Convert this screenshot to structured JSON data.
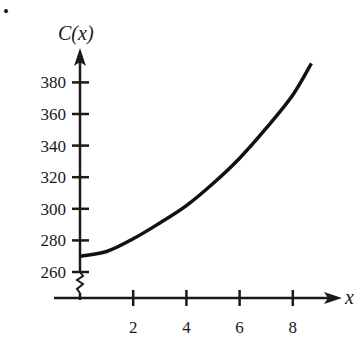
{
  "chart_data": {
    "type": "line",
    "title": "",
    "xlabel": "x",
    "ylabel": "C(x)",
    "x_ticks": [
      2,
      4,
      6,
      8
    ],
    "y_ticks": [
      260,
      280,
      300,
      320,
      340,
      360,
      380
    ],
    "xlim": [
      0,
      9.5
    ],
    "ylim": [
      240,
      395
    ],
    "y_axis_break": true,
    "grid": false,
    "legend": null,
    "series": [
      {
        "name": "C(x)",
        "x": [
          0,
          1,
          2,
          3,
          4,
          5,
          6,
          7,
          8,
          8.7
        ],
        "values": [
          270,
          273,
          281,
          291,
          302,
          316,
          332,
          351,
          372,
          392
        ]
      }
    ]
  },
  "labels": {
    "y_axis_title": "C(x)",
    "x_axis_title": "x",
    "bullet": "•"
  }
}
